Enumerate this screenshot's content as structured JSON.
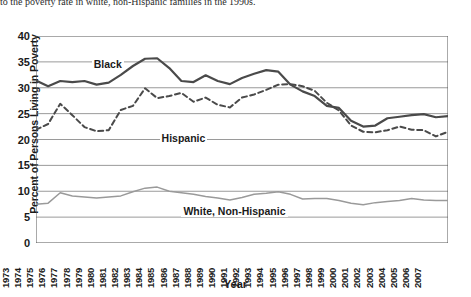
{
  "caption": "to the poverty rate in white, non-Hispanic families in the 1990s.",
  "chart_data": {
    "type": "line",
    "title": "",
    "xlabel": "Year",
    "ylabel": "Percent of Persons Living in Poverty",
    "xlim": [
      1973,
      2007
    ],
    "ylim": [
      0,
      40
    ],
    "ytick_step": 5,
    "yticks": [
      40,
      35,
      30,
      25,
      20,
      15,
      10,
      5,
      0
    ],
    "grid": true,
    "legend_position": "inline-labels",
    "x": [
      1973,
      1974,
      1975,
      1976,
      1977,
      1978,
      1979,
      1980,
      1981,
      1982,
      1983,
      1984,
      1985,
      1986,
      1987,
      1988,
      1989,
      1990,
      1991,
      1992,
      1993,
      1994,
      1995,
      1996,
      1997,
      1998,
      1999,
      2000,
      2001,
      2002,
      2003,
      2004,
      2005,
      2006,
      2007
    ],
    "series": [
      {
        "name": "Black",
        "color": "#4a4a4a",
        "style": "solid",
        "values": [
          31.4,
          30.3,
          31.3,
          31.1,
          31.3,
          30.6,
          31.0,
          32.5,
          34.2,
          35.6,
          35.7,
          33.8,
          31.3,
          31.1,
          32.4,
          31.3,
          30.7,
          31.9,
          32.7,
          33.4,
          33.1,
          30.6,
          29.3,
          28.4,
          26.5,
          26.1,
          23.6,
          22.5,
          22.7,
          24.1,
          24.4,
          24.7,
          24.9,
          24.3,
          24.5
        ]
      },
      {
        "name": "Hispanic",
        "color": "#4a4a4a",
        "style": "dashed",
        "values": [
          21.9,
          23.0,
          26.9,
          24.7,
          22.4,
          21.6,
          21.8,
          25.7,
          26.5,
          29.9,
          28.0,
          28.4,
          29.0,
          27.3,
          28.1,
          26.7,
          26.2,
          28.1,
          28.7,
          29.6,
          30.6,
          30.7,
          30.3,
          29.4,
          27.1,
          25.6,
          22.7,
          21.5,
          21.4,
          21.8,
          22.5,
          21.9,
          21.8,
          20.6,
          21.5
        ]
      },
      {
        "name": "White, Non-Hispanic",
        "color": "#9a9a9a",
        "style": "solid-thin",
        "values": [
          7.5,
          7.7,
          9.7,
          9.1,
          8.9,
          8.7,
          8.9,
          9.1,
          9.9,
          10.6,
          10.8,
          10.0,
          9.7,
          9.4,
          9.0,
          8.7,
          8.3,
          8.8,
          9.4,
          9.6,
          9.9,
          9.4,
          8.5,
          8.6,
          8.6,
          8.2,
          7.7,
          7.4,
          7.8,
          8.0,
          8.2,
          8.6,
          8.3,
          8.2,
          8.2
        ]
      }
    ],
    "annotations": [
      {
        "text": "Black",
        "x": 1977.6,
        "y": 34.3
      },
      {
        "text": "Hispanic",
        "x": 1983.2,
        "y": 20.1
      },
      {
        "text": "White, Non-Hispanic",
        "x": 1985.0,
        "y": 6.0
      }
    ]
  }
}
